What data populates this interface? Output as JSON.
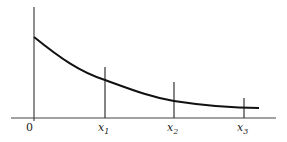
{
  "diagram": {
    "type": "decaying-curve-with-sample-points",
    "origin_label": "0",
    "x_markers": [
      {
        "label": "x",
        "sub": "1"
      },
      {
        "label": "x",
        "sub": "2"
      },
      {
        "label": "x",
        "sub": "3"
      }
    ],
    "colors": {
      "axis": "#444444",
      "curve": "#111111",
      "background": "#ffffff"
    }
  }
}
